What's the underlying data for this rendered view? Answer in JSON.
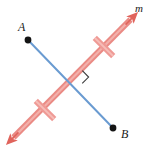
{
  "figure": {
    "kind": "geometry-diagram",
    "background_color": "#ffffff",
    "width": 157,
    "height": 149
  },
  "labels": {
    "point_a": "A",
    "point_b": "B",
    "line_m": "m"
  },
  "colors": {
    "segment": "#6a9bd1",
    "segment_light": "#a9c6e6",
    "line": "#ea8a84",
    "line_dark": "#e0645c",
    "tick": "#ef9a95",
    "point": "#141414",
    "right_angle": "#3a3a3a",
    "label": "#1a1a1a"
  },
  "geometry": {
    "point_a": {
      "x": 28,
      "y": 40
    },
    "point_b": {
      "x": 113,
      "y": 128
    },
    "line_m_start": {
      "x": 10,
      "y": 141
    },
    "line_m_end": {
      "x": 134,
      "y": 16
    },
    "intersection": {
      "x": 76,
      "y": 77
    },
    "tick_lower": {
      "x": 45,
      "y": 110
    },
    "tick_upper": {
      "x": 104,
      "y": 47
    },
    "point_radius": 3.4,
    "segment_width": 2,
    "line_width": 6,
    "tick_width": 6,
    "tick_length": 26,
    "right_angle_size": 9
  },
  "annotations": {
    "arrow_upper_right": "arrowhead",
    "arrow_lower_left": "arrowhead",
    "right_angle_mark": "right-angle-square",
    "congruence_ticks": 2
  }
}
